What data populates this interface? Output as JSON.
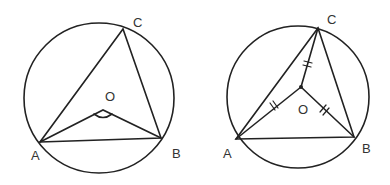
{
  "figures": [
    {
      "name": "left-figure",
      "description": "Triangle ABC inscribed in circle with center O; angle AOB marked",
      "labels": {
        "A": "A",
        "B": "B",
        "C": "C",
        "O": "O"
      },
      "circle": {
        "cx": 99,
        "cy": 98,
        "r": 75
      },
      "points": {
        "A": [
          40,
          142
        ],
        "B": [
          161,
          138
        ],
        "C": [
          123,
          29
        ],
        "O": [
          103,
          110
        ]
      },
      "angle_mark": "angle AOB"
    },
    {
      "name": "right-figure",
      "description": "Triangle ABC inscribed in circle with center O; OA = OB = OC marked with equal tick marks",
      "labels": {
        "A": "A",
        "B": "B",
        "C": "C",
        "O": "O"
      },
      "circle": {
        "cx": 298,
        "cy": 97,
        "r": 71
      },
      "points": {
        "A": [
          236,
          139
        ],
        "B": [
          354,
          137
        ],
        "C": [
          318,
          28
        ],
        "O": [
          301,
          87
        ]
      },
      "equal_marks": [
        "OA",
        "OB",
        "OC"
      ]
    }
  ],
  "colors": {
    "stroke": "#222222",
    "label": "#333333",
    "background": "#ffffff"
  }
}
